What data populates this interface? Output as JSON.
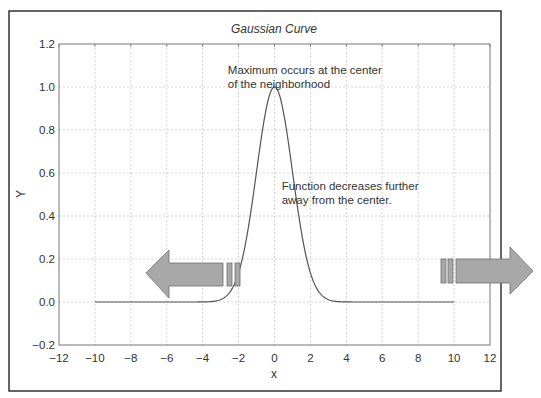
{
  "chart_data": {
    "type": "line",
    "title": "Gaussian Curve",
    "xlabel": "x",
    "ylabel": "Y",
    "xlim": [
      -12,
      12
    ],
    "ylim": [
      -0.2,
      1.2
    ],
    "xticks": [
      -12,
      -10,
      -8,
      -6,
      -4,
      -2,
      0,
      2,
      4,
      6,
      8,
      10,
      12
    ],
    "xtick_labels": [
      "−12",
      "−10",
      "−8",
      "−6",
      "−4",
      "−2",
      "0",
      "2",
      "4",
      "6",
      "8",
      "10",
      "12"
    ],
    "yticks": [
      -0.2,
      0.0,
      0.2,
      0.4,
      0.6,
      0.8,
      1.0,
      1.2
    ],
    "ytick_labels": [
      "−0.2",
      "0.0",
      "0.2",
      "0.4",
      "0.6",
      "0.8",
      "1.0",
      "1.2"
    ],
    "grid": true,
    "legend": null,
    "series": [
      {
        "name": "Gaussian",
        "function": "exp(-x^2/2)",
        "x": [
          -10,
          -4,
          -3,
          -2.5,
          -2,
          -1.5,
          -1,
          -0.5,
          0,
          0.5,
          1,
          1.5,
          2,
          2.5,
          3,
          4,
          10
        ],
        "y": [
          0.0,
          0.0003,
          0.011,
          0.044,
          0.135,
          0.325,
          0.607,
          0.882,
          1.0,
          0.882,
          0.607,
          0.325,
          0.135,
          0.044,
          0.011,
          0.0003,
          0.0
        ],
        "color": "#555555"
      }
    ],
    "annotations": [
      {
        "text_lines": [
          "Maximum occurs at the center",
          "of the neighborhood"
        ],
        "x": -2.6,
        "y": 1.06
      },
      {
        "text_lines": [
          "Function decreases further",
          "away from the center."
        ],
        "x": 0.4,
        "y": 0.52
      }
    ],
    "arrows": [
      {
        "name": "left-arrow",
        "direction": "left",
        "color": "#a8a8a8"
      },
      {
        "name": "right-arrow",
        "direction": "right",
        "color": "#a8a8a8"
      }
    ]
  }
}
